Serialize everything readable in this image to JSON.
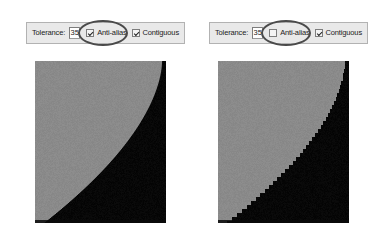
{
  "figure": {
    "comparison_type": "anti-alias-on-vs-off"
  },
  "panels": [
    {
      "id": "left",
      "toolbar": {
        "tolerance_label": "Tolerance:",
        "tolerance_value": "35",
        "antialias_label": "Anti-alias",
        "antialias_checked": true,
        "contiguous_label": "Contiguous",
        "contiguous_checked": true
      },
      "preview": {
        "name": "anti-aliased-edge-preview",
        "antialiased": true,
        "background_color": "#8a8a8a",
        "foreground_color": "#070707"
      },
      "annotation": {
        "name": "antialias-highlight-ellipse",
        "color": "#4a4a4a"
      }
    },
    {
      "id": "right",
      "toolbar": {
        "tolerance_label": "Tolerance:",
        "tolerance_value": "35",
        "antialias_label": "Anti-alias",
        "antialias_checked": false,
        "contiguous_label": "Contiguous",
        "contiguous_checked": true
      },
      "preview": {
        "name": "aliased-edge-preview",
        "antialiased": false,
        "background_color": "#8a8a8a",
        "foreground_color": "#070707"
      },
      "annotation": {
        "name": "antialias-highlight-ellipse",
        "color": "#4a4a4a"
      }
    }
  ]
}
